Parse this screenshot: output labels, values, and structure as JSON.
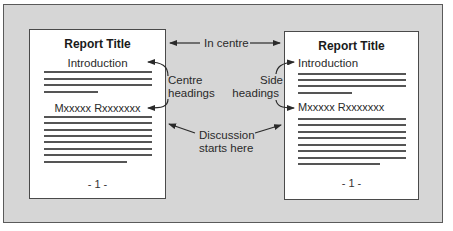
{
  "diagram": {
    "left_page": {
      "title": "Report Title",
      "heading_1": "Introduction",
      "heading_2": "Mxxxxx Rxxxxxxx",
      "page_number": "- 1 -",
      "heading_style": "centre"
    },
    "right_page": {
      "title": "Report Title",
      "heading_1": "Introduction",
      "heading_2": "Mxxxxx Rxxxxxxx",
      "page_number": "- 1 -",
      "heading_style": "side"
    },
    "annotations": {
      "in_centre": "In centre",
      "centre_headings_line1": "Centre",
      "centre_headings_line2": "headings",
      "side_headings_line1": "Side",
      "side_headings_line2": "headings",
      "discussion_line1": "Discussion",
      "discussion_line2": "starts here"
    },
    "colors": {
      "background_panel": "#d6d6d6",
      "page": "#ffffff",
      "ink": "#2a2a2a"
    }
  }
}
